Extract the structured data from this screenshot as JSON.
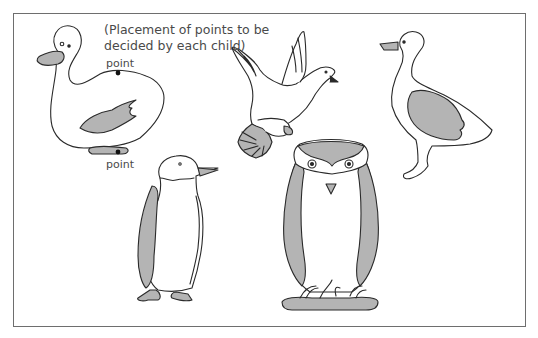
{
  "figure": {
    "instruction_line1": "(Placement of points to be",
    "instruction_line2": "decided by each child)",
    "point_top_label": "point",
    "point_bottom_label": "point"
  },
  "birds": [
    {
      "name": "duck",
      "annotated": true
    },
    {
      "name": "dove",
      "annotated": false
    },
    {
      "name": "goose",
      "annotated": false
    },
    {
      "name": "penguin",
      "annotated": false
    },
    {
      "name": "owl",
      "annotated": false
    }
  ],
  "colors": {
    "outline": "#2a2a2a",
    "fill_gray": "#b4b4b4",
    "frame": "#6e6e6e",
    "text": "#4a4a4a"
  }
}
